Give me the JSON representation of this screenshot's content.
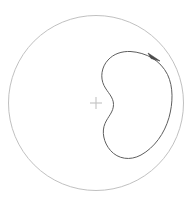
{
  "figure": {
    "title": "",
    "background_color": "#ffffff",
    "width": 196,
    "height": 209
  },
  "boundary_circle": {
    "name": "unit-disk-boundary",
    "center_x": 96,
    "center_y": 103,
    "radius": 87.5,
    "stroke_color": "#b9b9b9",
    "stroke_width": 0.9,
    "fill": "none"
  },
  "center_marker": {
    "name": "origin-crosshair",
    "x": 96,
    "y": 103,
    "arm_length": 6,
    "stroke_color": "#c2c2c2",
    "stroke_width": 1.1
  },
  "bean_curve": {
    "name": "kidney-contour",
    "stroke_color": "#5e5e5e",
    "stroke_width": 1.0,
    "fill": "none",
    "path": "M 130.5 51.5 C 146.5 52.5 160.5 60.5 167.5 74.5 C 173.5 87.0 173.0 103.0 169.0 117.5 C 164.5 133.5 154.5 147.5 141.0 155.0 C 130.0 161.0 118.0 159.0 110.5 150.5 C 103.5 142.5 101.5 131.5 105.0 123.5 C 108.0 116.5 113.5 112.0 113.5 104.5 C 113.5 97.0 107.5 92.5 104.0 85.5 C 100.0 77.5 101.5 67.0 108.0 60.0 C 113.5 54.0 121.5 51.0 130.5 51.5 Z",
    "direction": "clockwise"
  },
  "direction_arrow": {
    "name": "orientation-arrowhead",
    "tip_x": 160.0,
    "tip_y": 61.0,
    "tail_x": 149.0,
    "tail_y": 54.0,
    "color": "#4a4a4a",
    "points": "160.0,61.0 148.0,53.0 151.0,58.5"
  },
  "labels": {
    "caption": "",
    "axis_labels": [],
    "annotations": []
  },
  "chart_data": {
    "type": "line",
    "title": "",
    "xlabel": "",
    "ylabel": "",
    "grid": false,
    "legend": "none",
    "xlim": [
      8.5,
      183.5
    ],
    "ylim": [
      15.5,
      190.5
    ],
    "series": [
      {
        "name": "boundary-circle",
        "shape": "circle",
        "center": [
          96,
          103
        ],
        "radius": 87.5,
        "color": "#b9b9b9"
      },
      {
        "name": "kidney-contour",
        "shape": "closed-curve",
        "color": "#5e5e5e",
        "x": [
          130.5,
          152.0,
          167.5,
          171.5,
          169.0,
          158.0,
          141.0,
          124.0,
          110.5,
          103.5,
          107.5,
          113.5,
          110.0,
          104.0,
          100.5,
          108.0,
          119.0
        ],
        "y": [
          51.5,
          55.0,
          74.5,
          95.0,
          117.5,
          142.0,
          155.0,
          158.5,
          150.5,
          134.0,
          118.0,
          104.5,
          93.0,
          85.5,
          72.0,
          60.0,
          52.5
        ]
      },
      {
        "name": "origin-crosshair",
        "shape": "marker",
        "x": [
          96
        ],
        "y": [
          103
        ],
        "color": "#c2c2c2"
      }
    ]
  }
}
